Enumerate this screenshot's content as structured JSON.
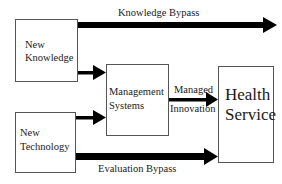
{
  "diagram": {
    "nodes": {
      "new_knowledge": {
        "line1": "New",
        "line2": "Knowledge"
      },
      "new_technology": {
        "line1": "New",
        "line2": "Technology"
      },
      "management_systems": {
        "line1": "Management",
        "line2": "Systems"
      },
      "health_service": {
        "line1": "Health",
        "line2": "Service"
      }
    },
    "edges": {
      "knowledge_bypass": {
        "label": "Knowledge Bypass",
        "from": "New Knowledge",
        "to": "Health Service (bypass)"
      },
      "knowledge_to_management": {
        "from": "New Knowledge",
        "to": "Management Systems"
      },
      "technology_to_management": {
        "from": "New Technology",
        "to": "Management Systems"
      },
      "managed_innovation": {
        "label_line1": "Managed",
        "label_line2": "Innovation",
        "from": "Management Systems",
        "to": "Health Service"
      },
      "evaluation_bypass": {
        "label": "Evaluation Bypass",
        "from": "New Technology",
        "to": "Health Service"
      }
    },
    "colors": {
      "arrow": "#000000",
      "border": "#555555",
      "text": "#1a1a1a",
      "background": "#ffffff"
    }
  }
}
